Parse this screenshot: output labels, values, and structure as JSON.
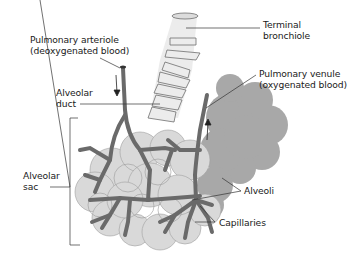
{
  "diagram": {
    "type": "anatomical-illustration",
    "colors": {
      "background": "#ffffff",
      "alveolar_sac_fill": "#d9d9d9",
      "alveolar_sac_outline": "#9a9a9a",
      "alveoli_cluster_fill": "#a8a8a8",
      "bronchiole_fill": "#ececec",
      "bronchiole_outline": "#6e6e6e",
      "vessel": "#6a6a6a",
      "leader_line": "#333333",
      "text": "#1a1a1a"
    },
    "labels": {
      "terminal_bronchiole": [
        "Terminal",
        "bronchiole"
      ],
      "pulmonary_arteriole": [
        "Pulmonary arteriole",
        "(deoxygenated blood)"
      ],
      "pulmonary_venule": [
        "Pulmonary venule",
        "(oxygenated blood)"
      ],
      "alveolar_duct": [
        "Alveolar",
        "duct"
      ],
      "alveolar_sac": [
        "Alveolar",
        "sac"
      ],
      "alveoli": [
        "Alveoli"
      ],
      "capillaries": [
        "Capillaries"
      ]
    },
    "arrows": [
      {
        "name": "arteriole-flow-arrow",
        "direction": "down"
      },
      {
        "name": "venule-flow-arrow",
        "direction": "up"
      }
    ]
  }
}
